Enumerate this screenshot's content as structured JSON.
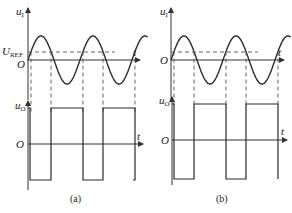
{
  "panels": [
    {
      "id": "a",
      "caption": "(a)",
      "input_axis_label": "u",
      "input_axis_sub": "I",
      "output_axis_label": "u",
      "output_axis_sub": "O",
      "time_label": "t",
      "origin_label": "O",
      "ref_label": "U",
      "ref_sub": "REF",
      "reference_level_fraction_of_amplitude": 0.35,
      "input_periods": 2.3,
      "output_levels": [
        "high",
        "low"
      ],
      "output_initial_state": "low"
    },
    {
      "id": "b",
      "caption": "(b)",
      "input_axis_label": "u",
      "input_axis_sub": "I",
      "output_axis_label": "u",
      "output_axis_sub": "O",
      "time_label": "t",
      "origin_label": "O",
      "reference_level_fraction_of_amplitude": 0.35,
      "input_periods": 2.3,
      "output_levels": [
        "high",
        "low"
      ],
      "output_initial_state": "low"
    }
  ]
}
